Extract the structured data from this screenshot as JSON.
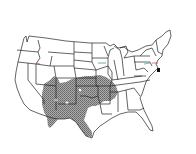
{
  "map": {
    "title": "",
    "region": "Contiguous United States",
    "type": "species range map",
    "colors": {
      "background": "#ffffff",
      "state_outline": "#222222",
      "range_fill": "#9a9a9a",
      "range_pattern_dot": "#5a5a5a",
      "accent_red": "#d23c50",
      "accent_green": "#2f8f6a"
    },
    "range": {
      "label": "",
      "description": "Shaded distribution covering southwestern and south-central states (Arizona, New Mexico, Texas, Oklahoma, southern Colorado, Kansas, Missouri, Arkansas)"
    }
  }
}
